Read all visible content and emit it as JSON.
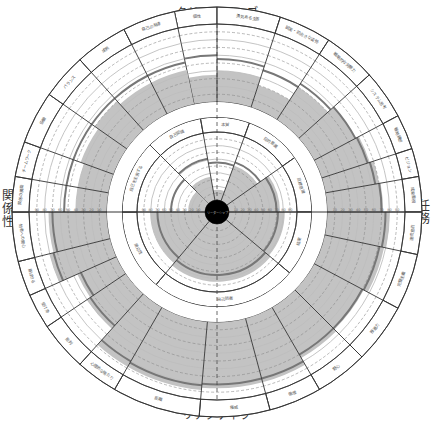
{
  "quadrant_labels": {
    "top": "クリエイティブ",
    "bottom": "リアクティブ",
    "left": "関係性",
    "right": "任務"
  },
  "center_label": "リーダーシップ",
  "colors": {
    "fill": "#c3c3c3",
    "line": "#333333",
    "grid": "#bdbdbd",
    "dash": "#8a8a8a",
    "score": "#777777",
    "center": "#000000"
  },
  "chart_data": {
    "type": "radial-band",
    "title": "",
    "scale_ticks": [
      "10",
      "20",
      "30",
      "40",
      "50",
      "60",
      "70",
      "80",
      "90"
    ],
    "inner_ring": {
      "segments": [
        {
          "label": "自己認識",
          "start": -45,
          "end": -10,
          "fill": 0.35,
          "score": 0.62
        },
        {
          "label": "本質",
          "start": -10,
          "end": 20,
          "fill": 0.15,
          "score": 0.55
        },
        {
          "label": "目的意識",
          "start": 20,
          "end": 55,
          "fill": 0.55,
          "score": 0.6
        },
        {
          "label": "目標意識",
          "start": 55,
          "end": 90,
          "fill": 0.75,
          "score": 0.7
        },
        {
          "label": "結果",
          "start": 90,
          "end": 130,
          "fill": 0.82,
          "score": 0.72
        },
        {
          "label": "自己防衛",
          "start": 130,
          "end": 220,
          "fill": 0.85,
          "score": 0.75
        },
        {
          "label": "順応性",
          "start": 220,
          "end": 270,
          "fill": 0.8,
          "score": 0.7
        },
        {
          "label": "自己を主張する",
          "start": 270,
          "end": 315,
          "fill": 0.25,
          "score": 0.5
        }
      ]
    },
    "outer_ring": {
      "segments": [
        {
          "label": "個性",
          "start": -12,
          "end": 0,
          "fill": 0.35,
          "score": 0.6
        },
        {
          "label": "勇気ある主張",
          "start": 0,
          "end": 18,
          "fill": 0.4,
          "score": 0.55
        },
        {
          "label": "誠実・前向きな姿勢",
          "start": 18,
          "end": 33,
          "fill": 0.3,
          "score": 0.5
        },
        {
          "label": "戦略的な洞察力",
          "start": 33,
          "end": 48,
          "fill": 0.5,
          "score": 0.55
        },
        {
          "label": "システム思考",
          "start": 48,
          "end": 62,
          "fill": 0.6,
          "score": 0.6
        },
        {
          "label": "戦略構想",
          "start": 62,
          "end": 72,
          "fill": 0.65,
          "score": 0.62
        },
        {
          "label": "ビジョン",
          "start": 72,
          "end": 80,
          "fill": 0.7,
          "score": 0.65
        },
        {
          "label": "成果重視",
          "start": 80,
          "end": 90,
          "fill": 0.72,
          "score": 0.7
        },
        {
          "label": "達成意欲",
          "start": 90,
          "end": 102,
          "fill": 0.8,
          "score": 0.75
        },
        {
          "label": "完璧主義",
          "start": 102,
          "end": 118,
          "fill": 0.78,
          "score": 0.72
        },
        {
          "label": "推進力",
          "start": 118,
          "end": 135,
          "fill": 0.72,
          "score": 0.7
        },
        {
          "label": "野心",
          "start": 135,
          "end": 150,
          "fill": 0.75,
          "score": 0.7
        },
        {
          "label": "傲慢",
          "start": 150,
          "end": 165,
          "fill": 0.85,
          "score": 0.8
        },
        {
          "label": "権威",
          "start": 165,
          "end": 185,
          "fill": 0.85,
          "score": 0.8
        },
        {
          "label": "距離",
          "start": 185,
          "end": 210,
          "fill": 0.88,
          "score": 0.82
        },
        {
          "label": "心理的な隔たり",
          "start": 210,
          "end": 222,
          "fill": 0.88,
          "score": 0.8
        },
        {
          "label": "批判",
          "start": 222,
          "end": 236,
          "fill": 0.6,
          "score": 0.55
        },
        {
          "label": "受け身",
          "start": 236,
          "end": 246,
          "fill": 0.55,
          "score": 0.5
        },
        {
          "label": "喜ばせる",
          "start": 246,
          "end": 256,
          "fill": 0.8,
          "score": 0.75
        },
        {
          "label": "他者への関心",
          "start": 256,
          "end": 270,
          "fill": 0.75,
          "score": 0.7
        },
        {
          "label": "関係の構築",
          "start": 270,
          "end": 280,
          "fill": 0.4,
          "score": 0.55
        },
        {
          "label": "チームワーク",
          "start": 280,
          "end": 290,
          "fill": 0.4,
          "score": 0.55
        },
        {
          "label": "協働",
          "start": 290,
          "end": 305,
          "fill": 0.45,
          "score": 0.55
        },
        {
          "label": "バランス",
          "start": 305,
          "end": 318,
          "fill": 0.5,
          "score": 0.55
        },
        {
          "label": "成熟",
          "start": 318,
          "end": 333,
          "fill": 0.45,
          "score": 0.55
        },
        {
          "label": "自己の発達",
          "start": 333,
          "end": 348,
          "fill": 0.45,
          "score": 0.55
        }
      ]
    }
  }
}
